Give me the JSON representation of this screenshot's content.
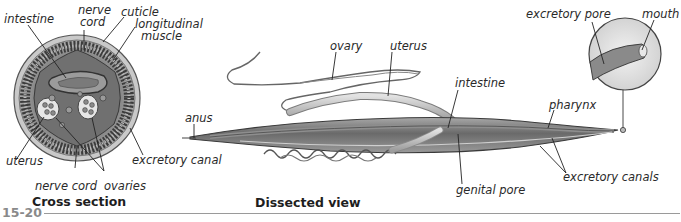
{
  "figure": {
    "number": "15-20",
    "panels": [
      {
        "caption": "Cross section",
        "labels": {
          "intestine": "intestine",
          "nerve_cord_top": "nerve cord",
          "nerve_cord_top_line1": "nerve",
          "nerve_cord_top_line2": "cord",
          "cuticle": "cuticle",
          "longitudinal_muscle_line1": "longitudinal",
          "longitudinal_muscle_line2": "muscle",
          "uterus": "uterus",
          "excretory_canal": "excretory canal",
          "nerve_cord_bottom": "nerve cord",
          "ovaries": "ovaries"
        }
      },
      {
        "caption": "Dissected view",
        "labels": {
          "ovary": "ovary",
          "uterus": "uterus",
          "intestine": "intestine",
          "anus": "anus",
          "pharynx": "pharynx",
          "genital_pore": "genital pore",
          "excretory_canals": "excretory canals",
          "excretory_pore": "excretory pore",
          "mouth": "mouth"
        }
      }
    ]
  },
  "colors": {
    "label_text": "#2a2a2a",
    "figure_number": "#8a8a8a",
    "rule": "#9a9a9a",
    "tissue_dark": "#4a4a4a",
    "tissue_mid": "#8c8c8c",
    "tissue_light": "#d6d6d6"
  }
}
